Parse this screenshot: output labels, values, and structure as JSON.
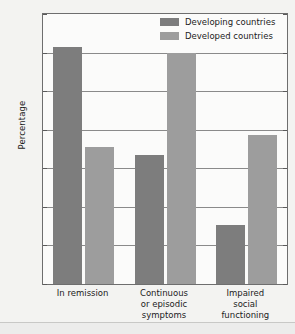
{
  "chart_data": {
    "type": "bar",
    "title": "",
    "xlabel": "",
    "ylabel": "Percentage",
    "ylim": [
      0,
      70
    ],
    "yticks": [
      0,
      10,
      20,
      30,
      40,
      50,
      60,
      70
    ],
    "grid": true,
    "legend_position": "top-right",
    "categories": [
      "In remission",
      "Continuous\nor episodic\nsymptoms",
      "Impaired\nsocial\nfunctioning"
    ],
    "series": [
      {
        "name": "Developing countries",
        "color": "#7d7d7d",
        "values": [
          61.5,
          33.5,
          15.3
        ]
      },
      {
        "name": "Developed countries",
        "color": "#9d9d9d",
        "values": [
          35.5,
          60.0,
          38.6
        ]
      }
    ]
  }
}
